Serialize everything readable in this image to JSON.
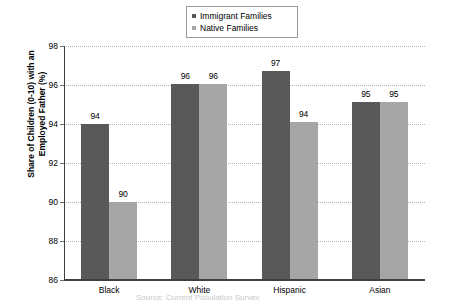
{
  "chart_data": {
    "type": "bar",
    "title": "",
    "subtitle": "",
    "xlabel": "",
    "ylabel": "Share of Children (0-10) with an Employed Father (%)",
    "categories": [
      "Black",
      "White",
      "Hispanic",
      "Asian"
    ],
    "series": [
      {
        "name": "Immigrant Families",
        "color": "#595959",
        "values": [
          94,
          96,
          97,
          95
        ],
        "plotted_values": [
          94.0,
          96.05,
          96.7,
          95.15
        ],
        "labels": [
          "94",
          "96",
          "97",
          "95"
        ]
      },
      {
        "name": "Native Families",
        "color": "#a6a6a6",
        "values": [
          90,
          96,
          94,
          95
        ],
        "plotted_values": [
          90.0,
          96.05,
          94.1,
          95.15
        ],
        "labels": [
          "90",
          "96",
          "94",
          "95"
        ]
      }
    ],
    "ylim": [
      86,
      98
    ],
    "yticks": [
      86,
      88,
      90,
      92,
      94,
      96,
      98
    ],
    "ytick_labels": [
      "86",
      "88",
      "90",
      "92",
      "94",
      "96",
      "98"
    ],
    "grid": true,
    "grid_style": "dotted-horizontal",
    "legend_position": "top-center",
    "legend_entries": [
      "Immigrant Families",
      "Native Families"
    ],
    "bar_gap_within_group": 0
  },
  "legend": {
    "items": [
      {
        "label": "Immigrant Families",
        "color": "#595959"
      },
      {
        "label": "Native Families",
        "color": "#a6a6a6"
      }
    ]
  },
  "y_axis": {
    "title_line1": "Share of Children (0-10) with an",
    "title_line2": "Employed Father (%)",
    "ticks": [
      "98",
      "96",
      "94",
      "92",
      "90",
      "88",
      "86"
    ]
  },
  "x_axis": {
    "labels": [
      "Black",
      "White",
      "Hispanic",
      "Asian"
    ]
  },
  "caption": {
    "cutoff_text": "Source: Current Population Survey"
  }
}
